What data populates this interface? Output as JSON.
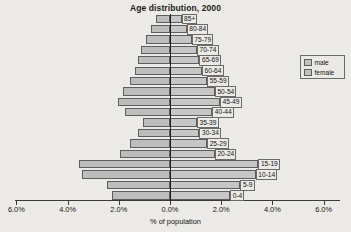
{
  "chart_data": {
    "type": "bar",
    "subtype": "population-pyramid",
    "title": "Age distribution, 2000",
    "xlabel": "% of population",
    "ylabel": "",
    "xlim": [
      -6.0,
      6.0
    ],
    "xticks": [
      "6.0%",
      "4.0%",
      "2.0%",
      "0.0%",
      "2.0%",
      "4.0%",
      "6.0%"
    ],
    "xtick_values": [
      -6.0,
      -4.0,
      -2.0,
      0.0,
      2.0,
      4.0,
      6.0
    ],
    "grid": false,
    "legend_position": "right",
    "categories": [
      "0-4",
      "5-9",
      "10-14",
      "15-19",
      "20-24",
      "25-29",
      "30-34",
      "35-39",
      "40-44",
      "45-49",
      "50-54",
      "55-59",
      "60-64",
      "65-69",
      "70-74",
      "75-79",
      "80-84",
      "85+"
    ],
    "series": [
      {
        "name": "male",
        "side": "left",
        "values": [
          2.25,
          2.45,
          3.45,
          3.55,
          1.95,
          1.55,
          1.25,
          1.05,
          1.75,
          2.05,
          1.85,
          1.55,
          1.35,
          1.25,
          1.15,
          0.95,
          0.75,
          0.55
        ]
      },
      {
        "name": "female",
        "side": "right",
        "values": [
          2.35,
          2.75,
          3.35,
          3.45,
          1.75,
          1.45,
          1.15,
          1.05,
          1.65,
          1.95,
          1.75,
          1.45,
          1.25,
          1.15,
          1.05,
          0.85,
          0.65,
          0.45
        ]
      }
    ],
    "colors": {
      "male_fill": "#bdbdbd",
      "female_fill": "#c6c6c6",
      "bar_stroke": "#5d5d5d",
      "axis": "#1d1d1d",
      "background": "#eceae6"
    }
  },
  "legend": {
    "items": [
      {
        "label": "male"
      },
      {
        "label": "female"
      }
    ]
  }
}
